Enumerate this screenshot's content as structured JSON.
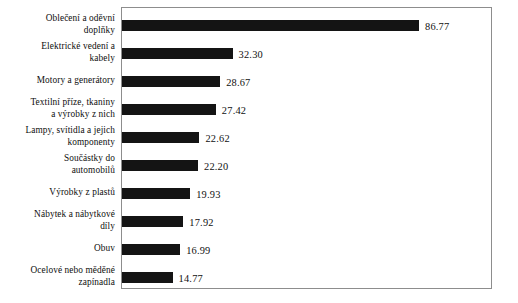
{
  "chart_data": {
    "type": "bar",
    "orientation": "horizontal",
    "title": "",
    "subtitle": "",
    "xlabel": "",
    "ylabel": "",
    "grid": false,
    "legend": null,
    "xlim": [
      0,
      100
    ],
    "categories": [
      "Oblečení a oděvní doplňky",
      "Elektrické vedení a kabely",
      "Motory a generátory",
      "Textilní příze, tkaniny a výrobky z nich",
      "Lampy, svítidla a jejich komponenty",
      "Součástky do automobilů",
      "Výrobky z plastů",
      "Nábytek a nábytkové díly",
      "Obuv",
      "Ocelové nebo měděné zapínadla"
    ],
    "category_lines": [
      [
        "Oblečení a oděvní",
        "doplňky"
      ],
      [
        "Elektrické vedení a",
        "kabely"
      ],
      [
        "Motory a generátory"
      ],
      [
        "Textilní příze, tkaniny",
        "a výrobky z nich"
      ],
      [
        "Lampy, svítidla a jejich",
        "komponenty"
      ],
      [
        "Součástky do",
        "automobilů"
      ],
      [
        "Výrobky z plastů"
      ],
      [
        "Nábytek a nábytkové",
        "díly"
      ],
      [
        "Obuv"
      ],
      [
        "Ocelové nebo měděné",
        "zapínadla"
      ]
    ],
    "values": [
      86.77,
      32.3,
      28.67,
      27.42,
      22.62,
      22.2,
      19.93,
      17.92,
      16.99,
      14.77
    ],
    "value_labels": [
      "86.77",
      "32.30",
      "28.67",
      "27.42",
      "22.62",
      "22.20",
      "19.93",
      "17.92",
      "16.99",
      "14.77"
    ],
    "bar_color": "#141414",
    "frame_color": "#8d8d8d",
    "background": "#ffffff"
  },
  "caption": {
    "text": ""
  }
}
